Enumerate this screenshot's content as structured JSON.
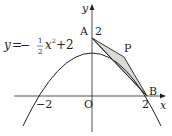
{
  "figure": {
    "equation": {
      "lhs": "y",
      "eq": "=",
      "minus": "−",
      "frac_num": "1",
      "frac_den": "2",
      "var": "x",
      "exp": "2",
      "tail": "+2"
    },
    "axes": {
      "x_label": "x",
      "y_label": "y",
      "origin_label": "O"
    },
    "ticks": {
      "x_neg": "−2",
      "x_pos": "2",
      "y_pos": "2"
    },
    "points": {
      "A": "A",
      "B": "B",
      "P": "P"
    },
    "colors": {
      "stroke": "#222222",
      "shade": "#d9d9d9"
    }
  }
}
